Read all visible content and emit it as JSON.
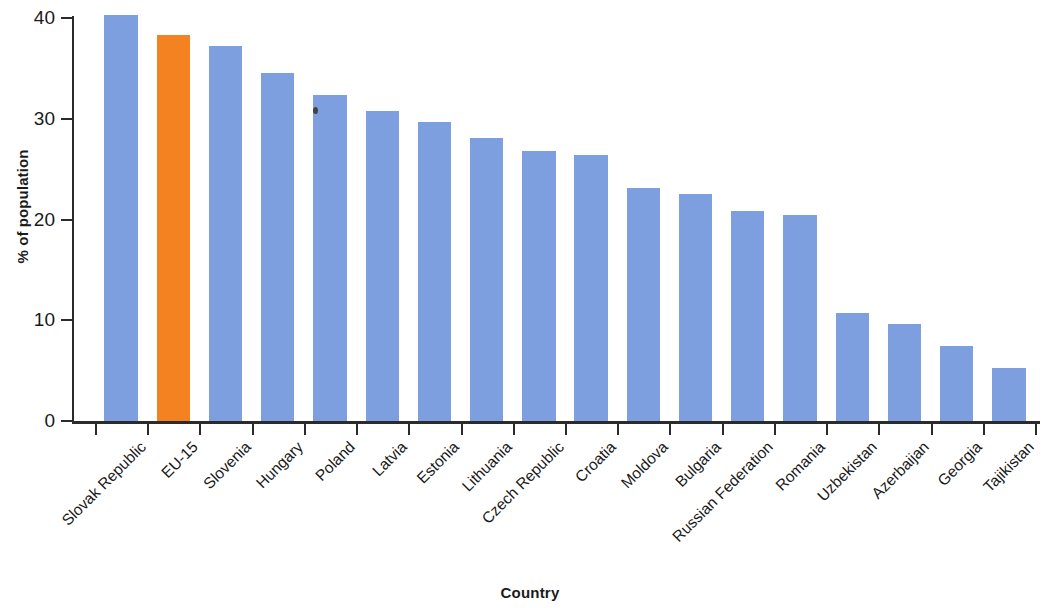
{
  "chart_data": {
    "type": "bar",
    "title": "",
    "xlabel": "Country",
    "ylabel": "% of population",
    "ylim": [
      0,
      40
    ],
    "yticks": [
      0,
      10,
      20,
      30,
      40
    ],
    "ytick_labels": [
      "0",
      "10",
      "20",
      "30",
      "40"
    ],
    "grid": false,
    "legend": null,
    "categories": [
      "Slovak Republic",
      "EU-15",
      "Slovenia",
      "Hungary",
      "Poland",
      "Latvia",
      "Estonia",
      "Lithuania",
      "Czech Republic",
      "Croatia",
      "Moldova",
      "Bulgaria",
      "Russian Federation",
      "Romania",
      "Uzbekistan",
      "Azerbaijan",
      "Georgia",
      "Tajikistan"
    ],
    "values": [
      40.3,
      38.3,
      37.2,
      34.5,
      32.4,
      30.8,
      29.7,
      28.1,
      26.8,
      26.4,
      23.1,
      22.5,
      20.8,
      20.4,
      10.7,
      9.6,
      7.4,
      5.3
    ],
    "bar_colors": [
      "#7d9fe0",
      "#f58220",
      "#7d9fe0",
      "#7d9fe0",
      "#7d9fe0",
      "#7d9fe0",
      "#7d9fe0",
      "#7d9fe0",
      "#7d9fe0",
      "#7d9fe0",
      "#7d9fe0",
      "#7d9fe0",
      "#7d9fe0",
      "#7d9fe0",
      "#7d9fe0",
      "#7d9fe0",
      "#7d9fe0",
      "#7d9fe0"
    ],
    "highlight_category": "EU-15",
    "colors": {
      "bar_default": "#7d9fe0",
      "bar_highlight": "#f58220",
      "axis": "#2b2b2b",
      "text": "#1a1a1a",
      "background": "#ffffff"
    }
  }
}
